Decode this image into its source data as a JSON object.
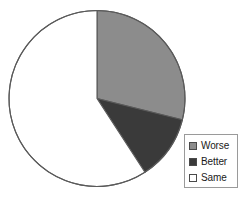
{
  "chart_data": {
    "type": "pie",
    "title": "",
    "categories": [
      "Worse",
      "Better",
      "Same"
    ],
    "values": [
      29,
      12,
      59
    ],
    "units": "percent",
    "start_angle_deg": 0,
    "direction": "clockwise",
    "slice_angles_deg": [
      104,
      43,
      213
    ],
    "colors": [
      "#8c8c8c",
      "#3a3a3a",
      "#ffffff"
    ],
    "outline_color": "#5a5a5a",
    "legend": {
      "position": "bottom-right",
      "border_color": "#9a9a9a",
      "background": "#ffffff",
      "entries": [
        {
          "label": "Worse",
          "color": "#8c8c8c"
        },
        {
          "label": "Better",
          "color": "#3a3a3a"
        },
        {
          "label": "Same",
          "color": "#ffffff"
        }
      ]
    },
    "xlabel": "",
    "ylabel": "",
    "grid": false
  },
  "geometry": {
    "center_x": 97,
    "center_y": 98.5,
    "radius": 88
  }
}
